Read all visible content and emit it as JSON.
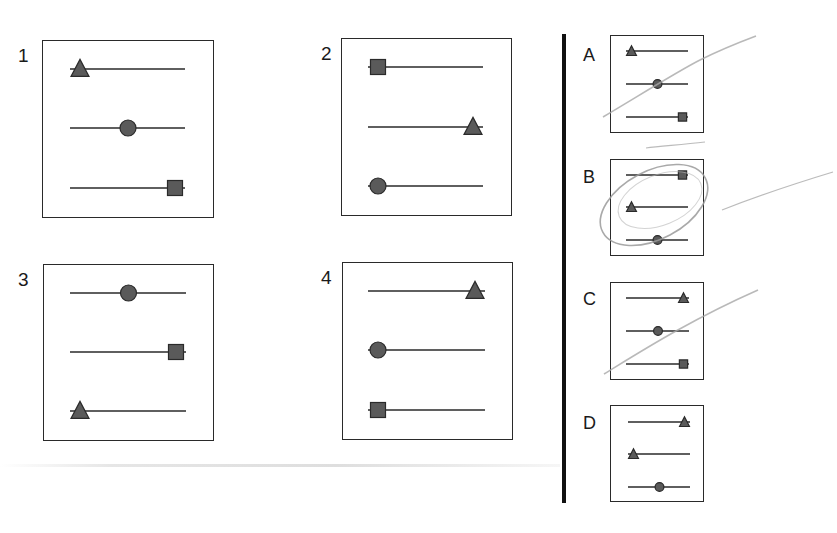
{
  "question": {
    "header_text_cutoff": ""
  },
  "colors": {
    "line": "#2a2a2a",
    "marker_fill": "#5a5a5a",
    "marker_stroke": "#2a2a2a",
    "pencil": "#9a9a9a"
  },
  "sequence": {
    "panels": [
      {
        "label": "1",
        "rows": [
          {
            "shape": "triangle",
            "position": "left"
          },
          {
            "shape": "circle",
            "position": "middle"
          },
          {
            "shape": "square",
            "position": "right"
          }
        ]
      },
      {
        "label": "2",
        "rows": [
          {
            "shape": "square",
            "position": "left"
          },
          {
            "shape": "triangle",
            "position": "right"
          },
          {
            "shape": "circle",
            "position": "left"
          }
        ]
      },
      {
        "label": "3",
        "rows": [
          {
            "shape": "circle",
            "position": "middle"
          },
          {
            "shape": "square",
            "position": "right"
          },
          {
            "shape": "triangle",
            "position": "left"
          }
        ]
      },
      {
        "label": "4",
        "rows": [
          {
            "shape": "triangle",
            "position": "right"
          },
          {
            "shape": "circle",
            "position": "left"
          },
          {
            "shape": "square",
            "position": "left"
          }
        ]
      }
    ]
  },
  "options": [
    {
      "label": "A",
      "rows": [
        {
          "shape": "triangle",
          "position": "left"
        },
        {
          "shape": "circle",
          "position": "middle"
        },
        {
          "shape": "square",
          "position": "right"
        }
      ],
      "crossed_out": true,
      "circled": false
    },
    {
      "label": "B",
      "rows": [
        {
          "shape": "square",
          "position": "right"
        },
        {
          "shape": "triangle",
          "position": "left"
        },
        {
          "shape": "circle",
          "position": "middle"
        }
      ],
      "crossed_out": false,
      "circled": true
    },
    {
      "label": "C",
      "rows": [
        {
          "shape": "triangle",
          "position": "right"
        },
        {
          "shape": "circle",
          "position": "middle"
        },
        {
          "shape": "square",
          "position": "right"
        }
      ],
      "crossed_out": true,
      "circled": false
    },
    {
      "label": "D",
      "rows": [
        {
          "shape": "triangle",
          "position": "right"
        },
        {
          "shape": "triangle",
          "position": "left"
        },
        {
          "shape": "circle",
          "position": "middle"
        }
      ],
      "crossed_out": false,
      "circled": false
    }
  ]
}
